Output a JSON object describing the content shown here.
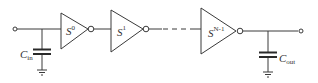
{
  "diagram": {
    "type": "inverter-chain",
    "colors": {
      "line": "#3a3a3a",
      "text": "#333333",
      "background": "#ffffff"
    },
    "input_capacitor": {
      "symbol": "C",
      "subscript": "in"
    },
    "output_capacitor": {
      "symbol": "C",
      "subscript": "out"
    },
    "stages": [
      {
        "symbol": "S",
        "superscript": "0"
      },
      {
        "symbol": "S",
        "superscript": "1"
      },
      {
        "symbol": "S",
        "superscript": "N-1"
      }
    ]
  }
}
